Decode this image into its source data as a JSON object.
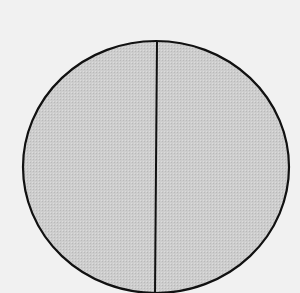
{
  "chart_data": {
    "type": "pie",
    "title": "",
    "categories": [
      "Left half",
      "Right half"
    ],
    "values": [
      50,
      50
    ],
    "slice_labels": [],
    "legend": [],
    "colors": {
      "background": "#f1f1f1",
      "fill": "#c9c9c9",
      "stroke": "#111111"
    },
    "geometry": {
      "cx": 156,
      "cy": 167,
      "rx": 133,
      "ry": 126,
      "divider_top_x": 157,
      "divider_bottom_x": 155
    }
  }
}
